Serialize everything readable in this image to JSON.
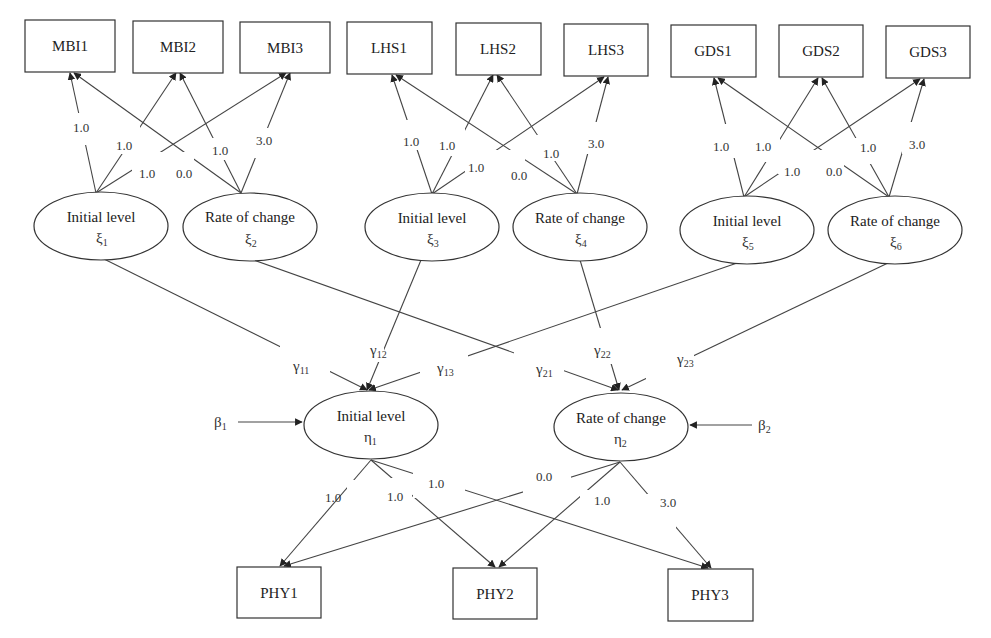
{
  "diagram": {
    "type": "latent growth curve structural equation model",
    "indicators_top": [
      {
        "id": "MBI1",
        "label": "MBI1"
      },
      {
        "id": "MBI2",
        "label": "MBI2"
      },
      {
        "id": "MBI3",
        "label": "MBI3"
      },
      {
        "id": "LHS1",
        "label": "LHS1"
      },
      {
        "id": "LHS2",
        "label": "LHS2"
      },
      {
        "id": "LHS3",
        "label": "LHS3"
      },
      {
        "id": "GDS1",
        "label": "GDS1"
      },
      {
        "id": "GDS2",
        "label": "GDS2"
      },
      {
        "id": "GDS3",
        "label": "GDS3"
      }
    ],
    "exogenous_factors": [
      {
        "id": "xi1",
        "label": "Initial level",
        "symbol": "ξ",
        "sub": "1"
      },
      {
        "id": "xi2",
        "label": "Rate of change",
        "symbol": "ξ",
        "sub": "2"
      },
      {
        "id": "xi3",
        "label": "Initial level",
        "symbol": "ξ",
        "sub": "3"
      },
      {
        "id": "xi4",
        "label": "Rate of change",
        "symbol": "ξ",
        "sub": "4"
      },
      {
        "id": "xi5",
        "label": "Initial level",
        "symbol": "ξ",
        "sub": "5"
      },
      {
        "id": "xi6",
        "label": "Rate of change",
        "symbol": "ξ",
        "sub": "6"
      }
    ],
    "endogenous_factors": [
      {
        "id": "eta1",
        "label": "Initial level",
        "symbol": "η",
        "sub": "1"
      },
      {
        "id": "eta2",
        "label": "Rate of change",
        "symbol": "η",
        "sub": "2"
      }
    ],
    "disturbances": [
      {
        "id": "beta1",
        "symbol": "β",
        "sub": "1"
      },
      {
        "id": "beta2",
        "symbol": "β",
        "sub": "2"
      }
    ],
    "indicators_bottom": [
      {
        "id": "PHY1",
        "label": "PHY1"
      },
      {
        "id": "PHY2",
        "label": "PHY2"
      },
      {
        "id": "PHY3",
        "label": "PHY3"
      }
    ],
    "loadings": {
      "group1": {
        "i1": "1.0",
        "i2": "1.0",
        "i3": "1.0",
        "r1": "0.0",
        "r2": "1.0",
        "r3": "3.0"
      },
      "group2": {
        "i1": "1.0",
        "i2": "1.0",
        "i3": "1.0",
        "r1": "0.0",
        "r2": "1.0",
        "r3": "3.0"
      },
      "group3": {
        "i1": "1.0",
        "i2": "1.0",
        "i3": "1.0",
        "r1": "0.0",
        "r2": "1.0",
        "r3": "3.0"
      },
      "bottom": {
        "i1": "1.0",
        "i2": "1.0",
        "i3": "1.0",
        "r1": "0.0",
        "r2": "1.0",
        "r3": "3.0"
      }
    },
    "paths": [
      {
        "symbol": "γ",
        "sub": "11"
      },
      {
        "symbol": "γ",
        "sub": "12"
      },
      {
        "symbol": "γ",
        "sub": "13"
      },
      {
        "symbol": "γ",
        "sub": "21"
      },
      {
        "symbol": "γ",
        "sub": "22"
      },
      {
        "symbol": "γ",
        "sub": "23"
      }
    ]
  }
}
